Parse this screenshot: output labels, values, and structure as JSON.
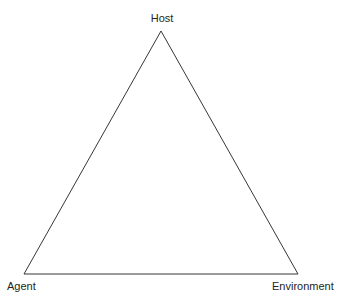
{
  "diagram": {
    "type": "triangle",
    "vertices": [
      {
        "id": "host",
        "label": "Host",
        "position": "top"
      },
      {
        "id": "agent",
        "label": "Agent",
        "position": "bottom-left"
      },
      {
        "id": "environment",
        "label": "Environment",
        "position": "bottom-right"
      }
    ],
    "edges": [
      [
        "host",
        "agent"
      ],
      [
        "agent",
        "environment"
      ],
      [
        "environment",
        "host"
      ]
    ],
    "colors": {
      "line": "#231f20",
      "text": "#231f20",
      "background": "#ffffff"
    }
  }
}
